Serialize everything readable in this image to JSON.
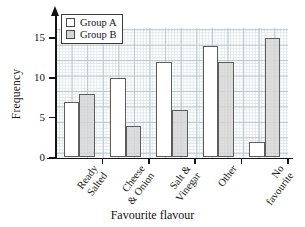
{
  "chart_data": {
    "type": "bar",
    "title": "",
    "xlabel": "Favourite flavour",
    "ylabel": "Frequency",
    "categories": [
      "Ready Salted",
      "Cheese & Onion",
      "Salt & Vinegar",
      "Other",
      "No favourite"
    ],
    "category_lines": [
      [
        "Ready",
        "Salted"
      ],
      [
        "Cheese",
        "& Onion"
      ],
      [
        "Salt &",
        "Vinegar"
      ],
      [
        "Other",
        ""
      ],
      [
        "No",
        "favourite"
      ]
    ],
    "series": [
      {
        "name": "Group A",
        "values": [
          7,
          10,
          12,
          14,
          2
        ],
        "color": "#ffffff"
      },
      {
        "name": "Group B",
        "values": [
          8,
          4,
          6,
          12,
          15
        ],
        "color": "#d5d5d5"
      }
    ],
    "ylim": [
      0,
      16.8
    ],
    "yticks": [
      0,
      5,
      10,
      15
    ],
    "ytick_labels": [
      "0",
      "5",
      "10",
      "15"
    ],
    "grid": true,
    "grid_minor": true,
    "legend_position": "top-left"
  },
  "legend": {
    "items": [
      {
        "label": "Group A"
      },
      {
        "label": "Group B"
      }
    ]
  },
  "axes": {
    "y_title": "Frequency",
    "x_title": "Favourite flavour"
  }
}
